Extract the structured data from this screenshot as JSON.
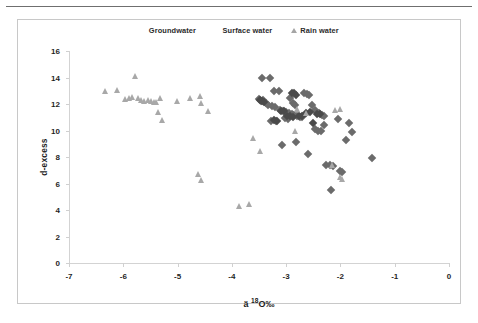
{
  "figure": {
    "border_color": "#c8c8c8",
    "rule_color": "#6f6f6f"
  },
  "legend": {
    "position": "top-center",
    "items": [
      {
        "label": "Groundwater",
        "marker": "diamond",
        "color": "#6b6b6b"
      },
      {
        "label": "Surface water",
        "marker": "diamond",
        "color": "#4a4a4a"
      },
      {
        "label": "Rain water",
        "marker": "triangle",
        "color": "#a5a5a5"
      }
    ]
  },
  "chart_data": {
    "type": "scatter",
    "title": "",
    "xlabel": "ä 18O‰",
    "xlabel_base": "ä ",
    "xlabel_sup": "18",
    "xlabel_tail": "O‰",
    "ylabel": "d-excess",
    "xlim": [
      -7,
      0
    ],
    "ylim": [
      0,
      16
    ],
    "xticks": [
      -7,
      -6,
      -5,
      -4,
      -3,
      -2,
      -1,
      0
    ],
    "xticklabels": [
      "-7",
      "-6",
      "-5",
      "-4",
      "-3",
      "-2",
      "-1",
      "0"
    ],
    "yticks": [
      0,
      2,
      4,
      6,
      8,
      10,
      12,
      14,
      16
    ],
    "yticklabels": [
      "0",
      "2",
      "4",
      "6",
      "8",
      "10",
      "12",
      "14",
      "16"
    ],
    "grid": false,
    "legend_position": "top-center",
    "series": [
      {
        "name": "Groundwater",
        "marker": "diamond",
        "color": "#6b6b6b",
        "points": [
          [
            -3.45,
            13.95
          ],
          [
            -3.3,
            14.0
          ],
          [
            -3.22,
            12.95
          ],
          [
            -3.14,
            12.95
          ],
          [
            -3.5,
            12.35
          ],
          [
            -3.46,
            12.2
          ],
          [
            -3.42,
            12.3
          ],
          [
            -3.38,
            12.05
          ],
          [
            -3.34,
            11.95
          ],
          [
            -3.26,
            11.85
          ],
          [
            -3.2,
            11.8
          ],
          [
            -2.93,
            12.45
          ],
          [
            -2.88,
            12.05
          ],
          [
            -2.83,
            11.95
          ],
          [
            -2.68,
            12.8
          ],
          [
            -2.62,
            12.75
          ],
          [
            -2.58,
            12.7
          ],
          [
            -3.12,
            11.55
          ],
          [
            -3.06,
            11.45
          ],
          [
            -3.0,
            11.4
          ],
          [
            -2.95,
            11.3
          ],
          [
            -2.9,
            11.25
          ],
          [
            -2.85,
            11.15
          ],
          [
            -2.8,
            11.1
          ],
          [
            -2.74,
            11.05
          ],
          [
            -2.7,
            11.0
          ],
          [
            -2.52,
            11.9
          ],
          [
            -2.46,
            11.55
          ],
          [
            -2.4,
            11.3
          ],
          [
            -2.34,
            11.2
          ],
          [
            -2.3,
            11.1
          ],
          [
            -3.28,
            10.75
          ],
          [
            -3.18,
            10.7
          ],
          [
            -3.02,
            10.95
          ],
          [
            -2.97,
            10.9
          ],
          [
            -2.47,
            10.15
          ],
          [
            -2.41,
            10.0
          ],
          [
            -2.36,
            9.95
          ],
          [
            -2.3,
            10.45
          ],
          [
            -3.07,
            8.9
          ],
          [
            -2.82,
            9.1
          ],
          [
            -2.59,
            8.2
          ],
          [
            -2.26,
            7.4
          ],
          [
            -2.2,
            7.4
          ],
          [
            -2.14,
            7.35
          ],
          [
            -2.18,
            5.5
          ],
          [
            -2.0,
            6.95
          ],
          [
            -1.98,
            6.85
          ],
          [
            -1.9,
            9.3
          ],
          [
            -1.84,
            10.55
          ],
          [
            -1.78,
            9.9
          ],
          [
            -2.05,
            10.9
          ],
          [
            -1.42,
            7.9
          ]
        ]
      },
      {
        "name": "Surface water",
        "marker": "diamond",
        "color": "#4a4a4a",
        "points": [
          [
            -3.49,
            12.3
          ],
          [
            -3.44,
            12.25
          ],
          [
            -3.4,
            12.15
          ],
          [
            -2.9,
            12.85
          ],
          [
            -2.86,
            12.8
          ],
          [
            -2.81,
            12.7
          ],
          [
            -3.1,
            11.5
          ],
          [
            -3.04,
            11.45
          ],
          [
            -2.99,
            11.1
          ],
          [
            -2.93,
            11.08
          ],
          [
            -2.87,
            11.05
          ],
          [
            -2.76,
            11.12
          ],
          [
            -2.71,
            11.08
          ],
          [
            -2.44,
            11.28
          ],
          [
            -2.38,
            11.22
          ],
          [
            -2.64,
            11.35
          ],
          [
            -2.56,
            11.4
          ],
          [
            -3.17,
            10.72
          ],
          [
            -3.23,
            10.78
          ],
          [
            -2.5,
            10.6
          ]
        ]
      },
      {
        "name": "Rain water",
        "marker": "triangle",
        "color": "#a8a8a8",
        "points": [
          [
            -6.32,
            12.95
          ],
          [
            -6.1,
            13.0
          ],
          [
            -5.77,
            14.05
          ],
          [
            -5.95,
            12.35
          ],
          [
            -5.88,
            12.45
          ],
          [
            -5.82,
            12.5
          ],
          [
            -5.72,
            12.45
          ],
          [
            -5.66,
            12.25
          ],
          [
            -5.6,
            12.2
          ],
          [
            -5.54,
            12.25
          ],
          [
            -5.48,
            12.2
          ],
          [
            -5.43,
            12.15
          ],
          [
            -5.38,
            12.1
          ],
          [
            -5.31,
            12.45
          ],
          [
            -5.34,
            11.35
          ],
          [
            -5.27,
            10.75
          ],
          [
            -5.0,
            12.2
          ],
          [
            -4.75,
            12.45
          ],
          [
            -4.58,
            12.6
          ],
          [
            -4.55,
            12.05
          ],
          [
            -4.43,
            11.45
          ],
          [
            -4.62,
            6.65
          ],
          [
            -4.55,
            6.2
          ],
          [
            -3.86,
            4.25
          ],
          [
            -3.68,
            4.45
          ],
          [
            -3.6,
            9.4
          ],
          [
            -3.47,
            8.45
          ],
          [
            -2.82,
            9.95
          ],
          [
            -2.78,
            11.6
          ],
          [
            -2.62,
            11.3
          ],
          [
            -2.08,
            11.5
          ],
          [
            -2.0,
            11.6
          ],
          [
            -2.14,
            7.35
          ],
          [
            -1.99,
            6.45
          ],
          [
            -1.96,
            6.3
          ]
        ]
      }
    ]
  }
}
